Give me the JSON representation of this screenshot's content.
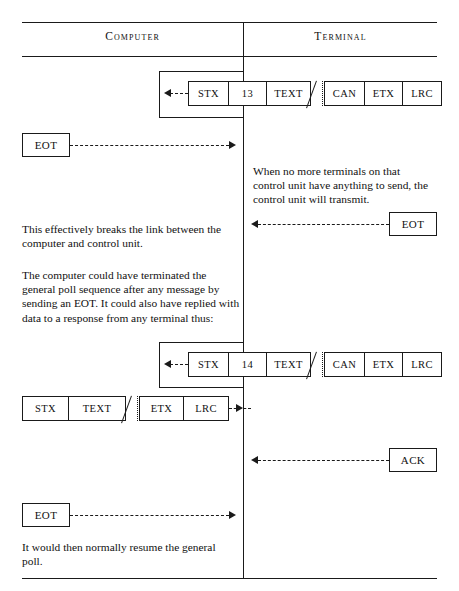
{
  "page_header": {
    "running_head": "",
    "folio": ""
  },
  "columns": {
    "left_label": "Computer",
    "right_label": "Terminal"
  },
  "frames": {
    "poll_response_13": {
      "cells_before_break": [
        "STX",
        "13",
        "TEXT"
      ],
      "cells_after_break": [
        "CAN",
        "ETX",
        "LRC"
      ],
      "direction": "terminal-to-computer"
    },
    "poll_response_14": {
      "cells_before_break": [
        "STX",
        "14",
        "TEXT"
      ],
      "cells_after_break": [
        "CAN",
        "ETX",
        "LRC"
      ],
      "direction": "terminal-to-computer"
    },
    "computer_data": {
      "cells_before_break": [
        "STX",
        "TEXT"
      ],
      "cells_after_break": [
        "ETX",
        "LRC"
      ],
      "direction": "computer-to-terminal"
    }
  },
  "signals": {
    "eot_from_computer_1": "EOT",
    "eot_from_terminal": "EOT",
    "ack_from_terminal": "ACK",
    "eot_from_computer_2": "EOT"
  },
  "notes": {
    "terminal_note": "When no more terminals on that control unit have anything to send, the control unit will transmit.",
    "break_note": "This effectively breaks the link between the computer and control unit.",
    "terminate_note": "The computer could have terminated the general poll sequence after any message by sending an EOT. It could also have replied with data to a response from any terminal thus:",
    "resume_note": "It would then normally resume the general poll."
  }
}
